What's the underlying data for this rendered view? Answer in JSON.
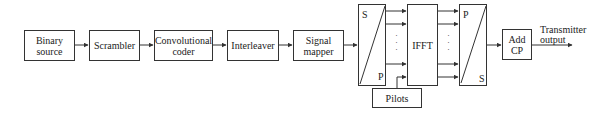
{
  "diagram": {
    "type": "block-diagram",
    "blocks": [
      {
        "id": "binary_source",
        "label": "Binary source"
      },
      {
        "id": "scrambler",
        "label": "Scrambler"
      },
      {
        "id": "conv_coder",
        "label": "Convolutional coder"
      },
      {
        "id": "interleaver",
        "label": "Interleaver"
      },
      {
        "id": "signal_mapper",
        "label": "Signal mapper"
      },
      {
        "id": "sp_converter",
        "top_label": "S",
        "bottom_label": "P"
      },
      {
        "id": "ifft",
        "label": "IFFT"
      },
      {
        "id": "ps_converter",
        "top_label": "P",
        "bottom_label": "S"
      },
      {
        "id": "add_cp",
        "label": "Add CP"
      },
      {
        "id": "pilots",
        "label": "Pilots"
      }
    ],
    "output_label": "Transmitter output",
    "parallel_dots": ":"
  }
}
